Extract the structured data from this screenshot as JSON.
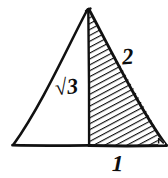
{
  "figure": {
    "background_color": "#ffffff",
    "ink_color": "#111111",
    "labels": {
      "left_side": "√3",
      "left_side_radical_symbol": "√",
      "left_side_radicand": "3",
      "hypotenuse": "2",
      "base": "1"
    },
    "marks": {
      "right_angle_marker": "right-angle-square"
    },
    "geometry": {
      "apex": [
        88,
        8
      ],
      "bottom_left": [
        12,
        146
      ],
      "bottom_right": [
        166,
        146
      ],
      "median_foot": [
        89,
        146
      ],
      "shaded_region": "right-half",
      "hatch_angle_degrees": 65,
      "hatch_spacing_px": 4
    }
  }
}
